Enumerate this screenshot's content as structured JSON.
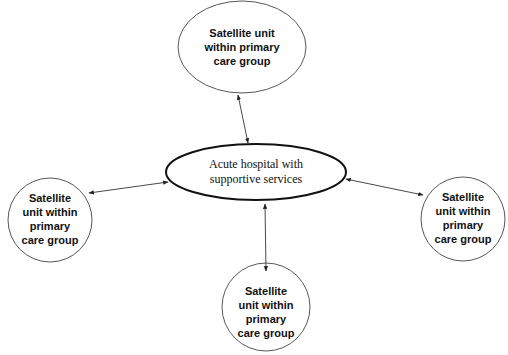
{
  "colors": {
    "background": "#ffffff",
    "stroke": "#222222",
    "text": "#111111"
  },
  "diagram": {
    "type": "hub-and-spoke",
    "hub": {
      "label_line1": "Acute hospital with",
      "label_line2": "supportive services",
      "shape": "ellipse"
    },
    "satellites": [
      {
        "position": "top",
        "shape": "ellipse",
        "lines": [
          "Satellite unit",
          "within primary",
          "care group"
        ]
      },
      {
        "position": "left",
        "shape": "circle",
        "lines": [
          "Satellite",
          "unit within",
          "primary",
          "care group"
        ]
      },
      {
        "position": "right",
        "shape": "circle",
        "lines": [
          "Satellite",
          "unit within",
          "primary",
          "care group"
        ]
      },
      {
        "position": "bottom",
        "shape": "circle",
        "lines": [
          "Satellite",
          "unit within",
          "primary",
          "care group"
        ]
      }
    ],
    "edges": [
      {
        "from": "hub",
        "to": "top",
        "type": "bidirectional-arrow"
      },
      {
        "from": "hub",
        "to": "left",
        "type": "bidirectional-arrow"
      },
      {
        "from": "hub",
        "to": "right",
        "type": "bidirectional-arrow"
      },
      {
        "from": "hub",
        "to": "bottom",
        "type": "bidirectional-arrow"
      }
    ]
  }
}
